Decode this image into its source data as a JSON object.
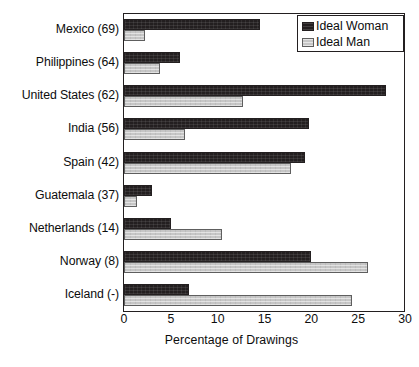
{
  "chart_data": {
    "type": "bar",
    "orientation": "horizontal",
    "title": "",
    "xlabel": "Percentage of Drawings",
    "ylabel": "",
    "xlim": [
      0,
      30
    ],
    "xticks": [
      0,
      5,
      10,
      15,
      20,
      25,
      30
    ],
    "grid": false,
    "legend_position": "top-right",
    "categories": [
      "Mexico (69)",
      "Philippines (64)",
      "United States (62)",
      "India (56)",
      "Spain (42)",
      "Guatemala (37)",
      "Netherlands (14)",
      "Norway (8)",
      "Iceland (-)"
    ],
    "series": [
      {
        "name": "Ideal Woman",
        "color": "#231f20",
        "values": [
          14.5,
          6.0,
          28.0,
          19.8,
          19.3,
          3.0,
          5.0,
          20.0,
          6.9
        ]
      },
      {
        "name": "Ideal Man",
        "color": "#c6c6c6",
        "values": [
          2.2,
          3.8,
          12.7,
          6.5,
          17.8,
          1.4,
          10.5,
          26.0,
          24.3
        ]
      }
    ]
  },
  "legend": {
    "items": [
      {
        "label": "Ideal Woman",
        "swatch": "woman"
      },
      {
        "label": "Ideal Man",
        "swatch": "man"
      }
    ]
  },
  "axis": {
    "x_title": "Percentage of Drawings",
    "x_tick_labels": [
      "0",
      "5",
      "10",
      "15",
      "20",
      "25",
      "30"
    ]
  },
  "colors": {
    "series_woman": "#231f20",
    "series_man": "#c6c6c6",
    "frame": "#231f20",
    "background": "#ffffff"
  }
}
